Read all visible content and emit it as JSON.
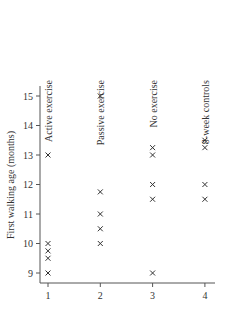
{
  "chart_data": {
    "type": "scatter",
    "title": "",
    "xlabel": "",
    "ylabel": "First walking age (months)",
    "x_ticks": [
      1,
      2,
      3,
      4
    ],
    "y_ticks": [
      9,
      10,
      11,
      12,
      13,
      14,
      15
    ],
    "xlim": [
      0.8,
      4.2
    ],
    "ylim": [
      8.8,
      15.5
    ],
    "grid": false,
    "marker": "x",
    "marker_color": "#333333",
    "groups": [
      {
        "x": 1,
        "name": "Active exercise",
        "values": [
          9,
          9.5,
          9.75,
          10,
          13
        ]
      },
      {
        "x": 2,
        "name": "Passive exercise",
        "values": [
          10,
          10.5,
          11,
          11.75,
          15
        ]
      },
      {
        "x": 3,
        "name": "No exercise",
        "values": [
          9,
          11.5,
          12,
          13,
          13.25
        ]
      },
      {
        "x": 4,
        "name": "8-week controls",
        "values": [
          11.5,
          12,
          13.25,
          13.5
        ]
      }
    ]
  }
}
